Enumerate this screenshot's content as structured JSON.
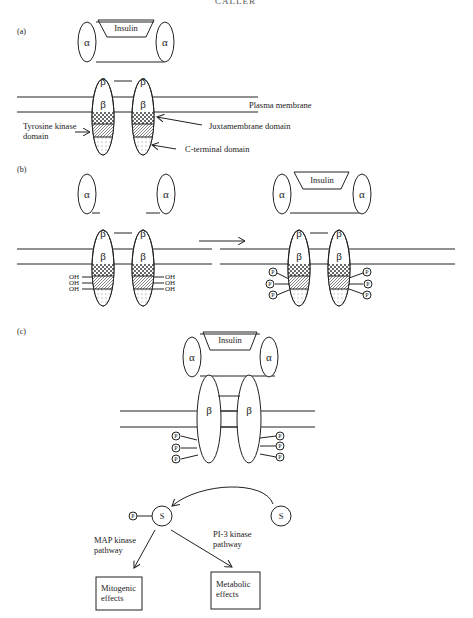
{
  "header": {
    "cut_text": "CALLER"
  },
  "panels": {
    "a": {
      "label": "(a)",
      "ligand": "Insulin",
      "alpha": "α",
      "beta": "β",
      "annotations": {
        "membrane": "Plasma membrane",
        "tk_line1": "Tyrosine kinase",
        "tk_line2": "domain",
        "juxta": "Juxtamembrane domain",
        "cterm": "C-terminal domain"
      }
    },
    "b": {
      "label": "(b)",
      "ligand": "Insulin",
      "alpha": "α",
      "beta": "β",
      "hydroxyl": "OH",
      "phospho": "P"
    },
    "c": {
      "label": "(c)",
      "ligand": "Insulin",
      "alpha": "α",
      "beta": "β",
      "phospho": "P",
      "substrate": "S",
      "map_line1": "MAP kinase",
      "map_line2": "pathway",
      "pi3_line1": "PI-3 kinase",
      "pi3_line2": "pathway",
      "mito_line1": "Mitogenic",
      "mito_line2": "effects",
      "meta_line1": "Metabolic",
      "meta_line2": "effects"
    }
  }
}
